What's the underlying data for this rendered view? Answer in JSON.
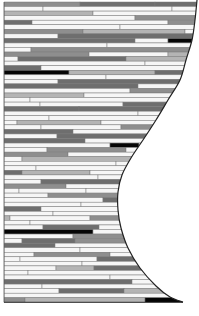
{
  "figure": {
    "left_x": 4,
    "top_y": 2,
    "row_height": 4.55,
    "row_count": 66,
    "palette": {
      "w": "#f6f6f6",
      "l": "#b4b4b4",
      "m": "#8e8e8e",
      "d": "#6e6e6e",
      "k": "#050505"
    },
    "outline_color": "#222222",
    "curve_points": [
      [
        197,
        0
      ],
      [
        195,
        20
      ],
      [
        192,
        40
      ],
      [
        186,
        60
      ],
      [
        180,
        80
      ],
      [
        168,
        100
      ],
      [
        156,
        120
      ],
      [
        143,
        140
      ],
      [
        131,
        158
      ],
      [
        122,
        175
      ],
      [
        118,
        192
      ],
      [
        118,
        210
      ],
      [
        121,
        228
      ],
      [
        128,
        248
      ],
      [
        140,
        268
      ],
      [
        156,
        286
      ],
      [
        170,
        297
      ],
      [
        183,
        302
      ]
    ],
    "rows": [
      [
        [
          0,
          80,
          "m"
        ],
        [
          80,
          155,
          "d"
        ],
        [
          155,
          199,
          "d"
        ]
      ],
      [
        [
          0,
          43,
          "w"
        ],
        [
          43,
          172,
          "w"
        ],
        [
          172,
          199,
          "w"
        ]
      ],
      [
        [
          0,
          93,
          "l"
        ],
        [
          93,
          199,
          "w"
        ]
      ],
      [
        [
          0,
          135,
          "w"
        ],
        [
          135,
          199,
          "m"
        ]
      ],
      [
        [
          0,
          32,
          "d"
        ],
        [
          32,
          168,
          "w"
        ],
        [
          168,
          199,
          "m"
        ]
      ],
      [
        [
          0,
          120,
          "w"
        ],
        [
          120,
          199,
          "w"
        ]
      ],
      [
        [
          0,
          83,
          "m"
        ],
        [
          83,
          185,
          "l"
        ],
        [
          185,
          199,
          "w"
        ]
      ],
      [
        [
          0,
          58,
          "w"
        ],
        [
          58,
          199,
          "d"
        ]
      ],
      [
        [
          0,
          135,
          "d"
        ],
        [
          135,
          168,
          "w"
        ],
        [
          168,
          199,
          "k"
        ]
      ],
      [
        [
          0,
          107,
          "w"
        ],
        [
          107,
          199,
          "w"
        ]
      ],
      [
        [
          0,
          31,
          "w"
        ],
        [
          31,
          199,
          "m"
        ]
      ],
      [
        [
          0,
          89,
          "m"
        ],
        [
          89,
          168,
          "w"
        ],
        [
          168,
          199,
          "l"
        ]
      ],
      [
        [
          0,
          18,
          "w"
        ],
        [
          18,
          126,
          "d"
        ],
        [
          126,
          199,
          "l"
        ]
      ],
      [
        [
          0,
          145,
          "w"
        ],
        [
          145,
          199,
          "w"
        ]
      ],
      [
        [
          0,
          41,
          "d"
        ],
        [
          41,
          199,
          "w"
        ]
      ],
      [
        [
          0,
          69,
          "k"
        ],
        [
          69,
          155,
          "l"
        ],
        [
          155,
          199,
          "d"
        ]
      ],
      [
        [
          0,
          106,
          "w"
        ],
        [
          106,
          199,
          "w"
        ]
      ],
      [
        [
          0,
          58,
          "w"
        ],
        [
          58,
          199,
          "d"
        ]
      ],
      [
        [
          0,
          138,
          "d"
        ],
        [
          138,
          199,
          "w"
        ]
      ],
      [
        [
          0,
          130,
          "w"
        ],
        [
          130,
          199,
          "m"
        ]
      ],
      [
        [
          0,
          84,
          "l"
        ],
        [
          84,
          199,
          "w"
        ]
      ],
      [
        [
          0,
          30,
          "w"
        ],
        [
          30,
          199,
          "w"
        ]
      ],
      [
        [
          0,
          40,
          "w"
        ],
        [
          40,
          123,
          "w"
        ],
        [
          123,
          199,
          "d"
        ]
      ],
      [
        [
          0,
          79,
          "d"
        ],
        [
          79,
          199,
          "d"
        ]
      ],
      [
        [
          0,
          138,
          "w"
        ],
        [
          138,
          199,
          "w"
        ]
      ],
      [
        [
          0,
          49,
          "w"
        ],
        [
          49,
          199,
          "w"
        ]
      ],
      [
        [
          0,
          17,
          "w"
        ],
        [
          17,
          101,
          "l"
        ],
        [
          101,
          199,
          "w"
        ]
      ],
      [
        [
          0,
          41,
          "w"
        ],
        [
          41,
          121,
          "w"
        ],
        [
          121,
          199,
          "m"
        ]
      ],
      [
        [
          0,
          73,
          "d"
        ],
        [
          73,
          199,
          "w"
        ]
      ],
      [
        [
          0,
          57,
          "w"
        ],
        [
          57,
          199,
          "d"
        ]
      ],
      [
        [
          0,
          85,
          "d"
        ],
        [
          85,
          199,
          "w"
        ]
      ],
      [
        [
          0,
          110,
          "w"
        ],
        [
          110,
          139,
          "k"
        ],
        [
          139,
          199,
          "w"
        ]
      ],
      [
        [
          0,
          47,
          "w"
        ],
        [
          47,
          126,
          "m"
        ],
        [
          126,
          199,
          "w"
        ]
      ],
      [
        [
          0,
          68,
          "m"
        ],
        [
          68,
          199,
          "w"
        ]
      ],
      [
        [
          0,
          22,
          "w"
        ],
        [
          22,
          199,
          "l"
        ]
      ],
      [
        [
          0,
          116,
          "w"
        ],
        [
          116,
          199,
          "w"
        ]
      ],
      [
        [
          0,
          36,
          "w"
        ],
        [
          36,
          199,
          "w"
        ]
      ],
      [
        [
          0,
          22,
          "d"
        ],
        [
          22,
          90,
          "l"
        ],
        [
          90,
          199,
          "w"
        ]
      ],
      [
        [
          0,
          98,
          "w"
        ],
        [
          98,
          199,
          "w"
        ]
      ],
      [
        [
          0,
          41,
          "w"
        ],
        [
          41,
          199,
          "d"
        ]
      ],
      [
        [
          0,
          66,
          "m"
        ],
        [
          66,
          199,
          "w"
        ]
      ],
      [
        [
          0,
          19,
          "w"
        ],
        [
          19,
          86,
          "w"
        ],
        [
          86,
          199,
          "w"
        ]
      ],
      [
        [
          0,
          48,
          "w"
        ],
        [
          48,
          199,
          "m"
        ]
      ],
      [
        [
          0,
          103,
          "w"
        ],
        [
          103,
          199,
          "d"
        ]
      ],
      [
        [
          0,
          81,
          "w"
        ],
        [
          81,
          199,
          "w"
        ]
      ],
      [
        [
          0,
          41,
          "d"
        ],
        [
          41,
          199,
          "w"
        ]
      ],
      [
        [
          0,
          53,
          "w"
        ],
        [
          53,
          199,
          "w"
        ]
      ],
      [
        [
          0,
          10,
          "l"
        ],
        [
          10,
          90,
          "w"
        ],
        [
          90,
          199,
          "m"
        ]
      ],
      [
        [
          0,
          30,
          "w"
        ],
        [
          30,
          199,
          "w"
        ]
      ],
      [
        [
          0,
          43,
          "w"
        ],
        [
          43,
          99,
          "d"
        ],
        [
          99,
          199,
          "w"
        ]
      ],
      [
        [
          0,
          93,
          "k"
        ],
        [
          93,
          199,
          "w"
        ]
      ],
      [
        [
          0,
          73,
          "w"
        ],
        [
          73,
          199,
          "m"
        ]
      ],
      [
        [
          0,
          22,
          "w"
        ],
        [
          22,
          75,
          "d"
        ],
        [
          75,
          199,
          "m"
        ]
      ],
      [
        [
          0,
          55,
          "d"
        ],
        [
          55,
          199,
          "w"
        ]
      ],
      [
        [
          0,
          80,
          "w"
        ],
        [
          80,
          199,
          "w"
        ]
      ],
      [
        [
          0,
          34,
          "w"
        ],
        [
          34,
          110,
          "m"
        ],
        [
          110,
          199,
          "w"
        ]
      ],
      [
        [
          0,
          20,
          "w"
        ],
        [
          20,
          97,
          "w"
        ],
        [
          97,
          199,
          "d"
        ]
      ],
      [
        [
          0,
          82,
          "w"
        ],
        [
          82,
          199,
          "w"
        ]
      ],
      [
        [
          0,
          56,
          "w"
        ],
        [
          56,
          94,
          "l"
        ],
        [
          94,
          199,
          "d"
        ]
      ],
      [
        [
          0,
          28,
          "w"
        ],
        [
          28,
          199,
          "w"
        ]
      ],
      [
        [
          0,
          110,
          "w"
        ],
        [
          110,
          199,
          "w"
        ]
      ],
      [
        [
          0,
          132,
          "d"
        ],
        [
          132,
          199,
          "w"
        ]
      ],
      [
        [
          0,
          42,
          "w"
        ],
        [
          42,
          199,
          "w"
        ]
      ],
      [
        [
          0,
          59,
          "w"
        ],
        [
          59,
          124,
          "d"
        ],
        [
          124,
          199,
          "l"
        ]
      ],
      [
        [
          0,
          176,
          "w"
        ],
        [
          176,
          199,
          "w"
        ]
      ],
      [
        [
          0,
          25,
          "m"
        ],
        [
          25,
          145,
          "l"
        ],
        [
          145,
          199,
          "k"
        ]
      ]
    ]
  }
}
